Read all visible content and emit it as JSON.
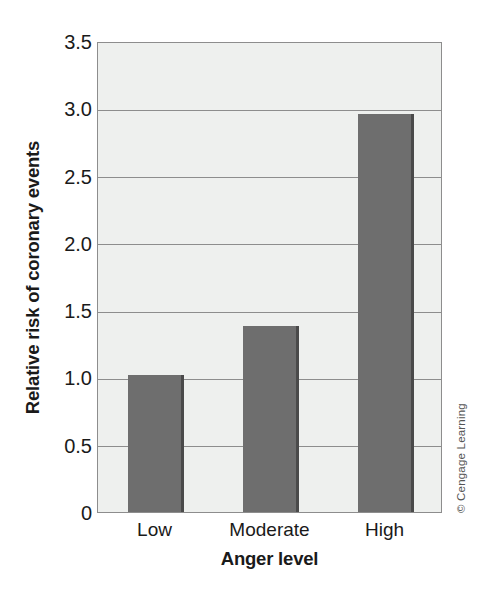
{
  "chart_data": {
    "type": "bar",
    "title": "",
    "subtitle": "",
    "categories": [
      "Low",
      "Moderate",
      "High"
    ],
    "values": [
      1.02,
      1.38,
      2.96
    ],
    "series": [
      {
        "name": "Relative risk of coronary events",
        "values": [
          1.02,
          1.38,
          2.96
        ]
      }
    ],
    "xlabel": "Anger level",
    "ylabel": "Relative risk of coronary events",
    "ylim": [
      0,
      3.5
    ],
    "yticks": [
      0,
      0.5,
      1.0,
      1.5,
      2.0,
      2.5,
      3.0,
      3.5
    ],
    "ytick_labels": [
      "0",
      "0.5",
      "1.0",
      "1.5",
      "2.0",
      "2.5",
      "3.0",
      "3.5"
    ],
    "grid": true,
    "grid_axis": "y",
    "legend": false,
    "legend_position": "none",
    "annotations": [
      "© Cengage Learning"
    ]
  },
  "axes": {
    "y_title": "Relative risk of coronary events",
    "x_title": "Anger level"
  },
  "credit": {
    "text": "© Cengage Learning"
  },
  "colors": {
    "bar_fill": "#6e6e6e",
    "bar_edge": "#4a4a4a",
    "plot_background": "#eef0ee",
    "gridline": "#8d8d8d",
    "axis_border": "#8d8d8d",
    "text": "#1a1a1a",
    "credit_text": "#555555",
    "page_background": "#ffffff"
  }
}
